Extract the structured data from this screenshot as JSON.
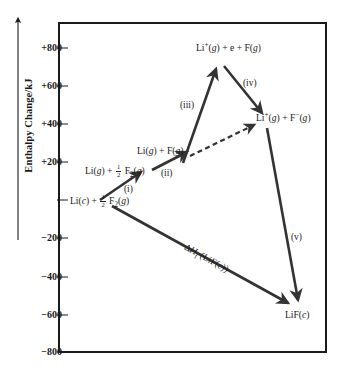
{
  "figure": {
    "type": "energy-level-diagram",
    "axis": {
      "label": "Enthalpy Change/kJ",
      "unit": "kJ",
      "direction": "up",
      "ticks": [
        {
          "value": 800,
          "label": "+800"
        },
        {
          "value": 600,
          "label": "+600"
        },
        {
          "value": 400,
          "label": "+400"
        },
        {
          "value": 200,
          "label": "+200"
        },
        {
          "value": 0,
          "label": ""
        },
        {
          "value": -200,
          "label": "−200"
        },
        {
          "value": -400,
          "label": "−400"
        },
        {
          "value": -600,
          "label": "−600"
        },
        {
          "value": -800,
          "label": "−800"
        }
      ],
      "ylim": [
        -800,
        900
      ]
    },
    "species": [
      {
        "id": "li-c-f2",
        "text": "Li(c) + ½ F₂(g)",
        "enthalpy": 0
      },
      {
        "id": "li-g-f2",
        "text": "Li(g) + ½ F₂(g)",
        "enthalpy": 161
      },
      {
        "id": "li-g-f-g",
        "text": "Li(g) + F(g)",
        "enthalpy": 240
      },
      {
        "id": "li-plus-e-f",
        "text": "Li⁺(g) + e + F(g)",
        "enthalpy": 760
      },
      {
        "id": "li-plus-f-minus",
        "text": "Li⁺(g) + F⁻(g)",
        "enthalpy": 430
      },
      {
        "id": "lif-c",
        "text": "LiF(c)",
        "enthalpy": -594
      }
    ],
    "steps": [
      {
        "id": "i",
        "label": "(i)",
        "from": "li-c-f2",
        "to": "li-g-f2",
        "style": "solid"
      },
      {
        "id": "ii",
        "label": "(ii)",
        "from": "li-g-f2",
        "to": "li-g-f-g",
        "style": "solid"
      },
      {
        "id": "iii",
        "label": "(iii)",
        "from": "li-g-f-g",
        "to": "li-plus-e-f",
        "style": "solid"
      },
      {
        "id": "iv",
        "label": "(iv)",
        "from": "li-plus-e-f",
        "to": "li-plus-f-minus",
        "style": "solid"
      },
      {
        "id": "v",
        "label": "(v)",
        "from": "li-plus-f-minus",
        "to": "lif-c",
        "style": "solid"
      },
      {
        "id": "dash",
        "label": "",
        "from": "li-g-f-g",
        "to": "li-plus-f-minus",
        "style": "dashed"
      }
    ],
    "annotation": {
      "delta": "Δ",
      "h": "H",
      "subscript": "f",
      "argument": "(LiF(c))",
      "full": "ΔHf (LiF(c))"
    },
    "colors": {
      "ink": "#1a1a1a",
      "background": "#ffffff",
      "arrow": "#333333"
    }
  }
}
